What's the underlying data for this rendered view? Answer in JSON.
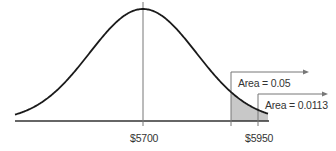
{
  "chart_data": {
    "type": "area",
    "title": "",
    "xlabel": "",
    "ylabel": "",
    "distribution": "normal",
    "mean": 5700,
    "tick_labels": [
      "$5700",
      "$5950"
    ],
    "ticks": [
      5700,
      5950
    ],
    "annotations": [
      {
        "label": "Area = 0.05",
        "region": "right tail beyond critical value",
        "area": 0.05
      },
      {
        "label": "Area = 0.0113",
        "region": "right tail beyond $5950",
        "area": 0.0113
      }
    ],
    "shaded_region": {
      "from": "critical value (z≈1.645)",
      "to": "right end",
      "color": "#c8c8c8"
    },
    "grid": false,
    "legend": "none"
  },
  "labels": {
    "mean": "$5700",
    "value": "$5950",
    "area_alpha": "Area = 0.05",
    "area_p": "Area = 0.0113"
  },
  "colors": {
    "curve": "#1a1a1a",
    "axis": "#333333",
    "marker_lines": "#777777",
    "shade": "#c8c8c8"
  }
}
